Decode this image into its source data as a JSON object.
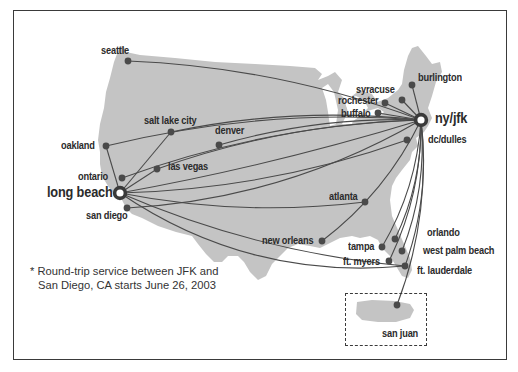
{
  "map": {
    "title": "Route map",
    "colors": {
      "land": "#c4c4c4",
      "route": "#4a4a4a",
      "dot": "#4a4a4a",
      "frame": "#3a3a3a"
    },
    "hubs": [
      {
        "id": "jfk",
        "label": "ny/jfk"
      },
      {
        "id": "lgb",
        "label": "long beach"
      }
    ],
    "cities": [
      {
        "id": "seattle",
        "label": "seattle",
        "routes_from": [
          "jfk"
        ]
      },
      {
        "id": "slc",
        "label": "salt lake city",
        "routes_from": [
          "jfk",
          "lgb"
        ]
      },
      {
        "id": "denver",
        "label": "denver",
        "routes_from": [
          "jfk"
        ]
      },
      {
        "id": "oakland",
        "label": "oakland",
        "routes_from": [
          "jfk",
          "lgb"
        ]
      },
      {
        "id": "lasvegas",
        "label": "las vegas",
        "routes_from": [
          "jfk",
          "lgb"
        ]
      },
      {
        "id": "ontario",
        "label": "ontario",
        "routes_from": [
          "jfk"
        ]
      },
      {
        "id": "sandiego",
        "label": "san diego",
        "routes_from": [
          "jfk"
        ]
      },
      {
        "id": "atlanta",
        "label": "atlanta",
        "routes_from": [
          "lgb"
        ]
      },
      {
        "id": "neworleans",
        "label": "new orleans",
        "routes_from": [
          "jfk"
        ]
      },
      {
        "id": "tampa",
        "label": "tampa",
        "routes_from": [
          "jfk"
        ]
      },
      {
        "id": "ftmyers",
        "label": "ft. myers",
        "routes_from": [
          "jfk"
        ]
      },
      {
        "id": "orlando",
        "label": "orlando",
        "routes_from": [
          "jfk"
        ]
      },
      {
        "id": "wpb",
        "label": "west palm beach",
        "routes_from": [
          "jfk"
        ]
      },
      {
        "id": "ftl",
        "label": "ft. lauderdale",
        "routes_from": [
          "jfk",
          "lgb"
        ]
      },
      {
        "id": "dulles",
        "label": "dc/dulles",
        "routes_from": [
          "lgb"
        ]
      },
      {
        "id": "buffalo",
        "label": "buffalo",
        "routes_from": [
          "jfk"
        ]
      },
      {
        "id": "rochester",
        "label": "rochester",
        "routes_from": [
          "jfk"
        ]
      },
      {
        "id": "syracuse",
        "label": "syracuse",
        "routes_from": [
          "jfk"
        ]
      },
      {
        "id": "burlington",
        "label": "burlington",
        "routes_from": [
          "jfk"
        ]
      },
      {
        "id": "sanjuan",
        "label": "san juan",
        "routes_from": [
          "jfk"
        ]
      }
    ],
    "direct_hub_route": true,
    "footnote": {
      "line1": "* Round-trip service between JFK and",
      "line2": "San Diego, CA starts June 26, 2003"
    }
  }
}
